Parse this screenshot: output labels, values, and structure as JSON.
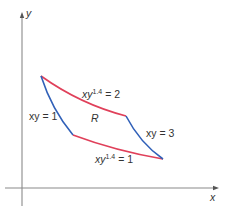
{
  "diagram": {
    "type": "region-in-plane",
    "axes": {
      "x_label": "x",
      "y_label": "y",
      "color": "#555555"
    },
    "region": {
      "label": "R"
    },
    "curves": [
      {
        "id": "top",
        "equation_prefix": "xy",
        "exponent": "1.4",
        "equation_suffix": " = 2",
        "color": "#e0405a"
      },
      {
        "id": "bottom",
        "equation_prefix": "xy",
        "exponent": "1.4",
        "equation_suffix": " = 1",
        "color": "#e0405a"
      },
      {
        "id": "left",
        "equation": "xy = 1",
        "color": "#3060b8"
      },
      {
        "id": "right",
        "equation": "xy = 3",
        "color": "#3060b8"
      }
    ]
  }
}
